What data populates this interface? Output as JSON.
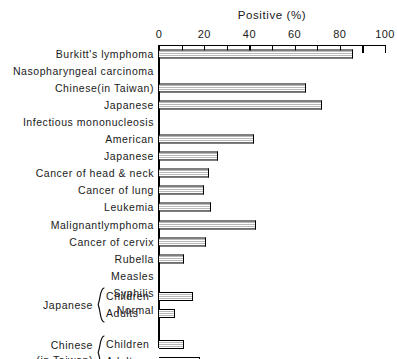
{
  "chart": {
    "title": "Positive (%)",
    "axis": {
      "xlabel": "Positive (%)",
      "tick_labels": [
        "0",
        "20",
        "40",
        "60",
        "80",
        "100"
      ],
      "tick_values": [
        0,
        20,
        40,
        60,
        80,
        100
      ],
      "minor_tick_step": 10,
      "xmin": 0,
      "xmax": 100
    }
  },
  "chart_data": {
    "type": "bar",
    "orientation": "horizontal",
    "title": "Positive (%)",
    "xlabel": "Positive (%)",
    "ylabel": "",
    "xlim": [
      0,
      100
    ],
    "grid": false,
    "legend": null,
    "categories": [
      "Burkitt's lymphoma",
      "Nasopharyngeal carcinoma",
      "Chinese(in Taiwan)",
      "Japanese",
      "Infectious mononucleosis",
      "American",
      "Japanese",
      "Cancer of head & neck",
      "Cancer of lung",
      "Leukemia",
      "Malignantlymphoma",
      "Cancer of cervix",
      "Rubella",
      "Measles",
      "Syphilis",
      "Normal",
      "Japanese Children",
      "Japanese Adults",
      "Chinese (in Taiwan) Children",
      "Chinese (in Taiwan) Adults"
    ],
    "values": [
      86,
      null,
      65,
      72,
      null,
      42,
      26,
      22,
      20,
      23,
      43,
      21,
      11,
      0,
      0,
      0,
      15,
      7,
      11,
      18
    ]
  },
  "rows": [
    {
      "label": "Burkitt's lymphoma",
      "indent": false,
      "value": 86,
      "header": false
    },
    {
      "label": "Nasopharyngeal carcinoma",
      "indent": false,
      "value": null,
      "header": true
    },
    {
      "label": "Chinese(in Taiwan)",
      "indent": true,
      "value": 65,
      "header": false
    },
    {
      "label": "Japanese",
      "indent": true,
      "value": 72,
      "header": false
    },
    {
      "label": "Infectious mononucleosis",
      "indent": false,
      "value": null,
      "header": true
    },
    {
      "label": "American",
      "indent": true,
      "value": 42,
      "header": false
    },
    {
      "label": "Japanese",
      "indent": true,
      "value": 26,
      "header": false
    },
    {
      "label": "Cancer of head & neck",
      "indent": false,
      "value": 22,
      "header": false
    },
    {
      "label": "Cancer of lung",
      "indent": false,
      "value": 20,
      "header": false
    },
    {
      "label": "Leukemia",
      "indent": false,
      "value": 23,
      "header": false
    },
    {
      "label": "Malignantlymphoma",
      "indent": false,
      "value": 43,
      "header": false
    },
    {
      "label": "Cancer of cervix",
      "indent": false,
      "value": 21,
      "header": false
    },
    {
      "label": "Rubella",
      "indent": false,
      "value": 11,
      "header": false
    },
    {
      "label": "Measles",
      "indent": false,
      "value": 0,
      "header": false
    },
    {
      "label": "Syphilis",
      "indent": false,
      "value": 0,
      "header": false
    },
    {
      "label": "Normal",
      "indent": false,
      "value": 0,
      "header": false
    }
  ],
  "groups": [
    {
      "name_line1": "Japanese",
      "name_line2": "",
      "items": [
        {
          "label": "Children",
          "value": 15
        },
        {
          "label": "Adults",
          "value": 7
        }
      ]
    },
    {
      "name_line1": "Chinese",
      "name_line2": "(in Taiwan)",
      "items": [
        {
          "label": "Children",
          "value": 11
        },
        {
          "label": "Adults",
          "value": 18
        }
      ]
    }
  ],
  "colors": {
    "ink": "#1a1a1a",
    "line": "#000000",
    "bar_fill": "#b9b9b9",
    "background": "#ffffff"
  }
}
